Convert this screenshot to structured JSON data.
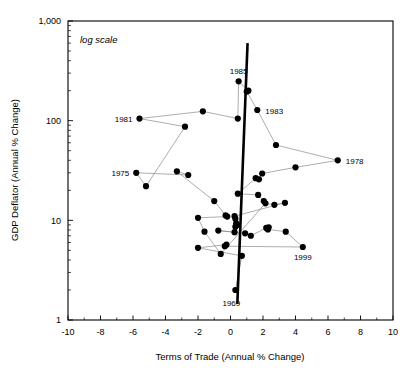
{
  "chart_data": {
    "type": "scatter",
    "title": "",
    "xlabel": "Terms of Trade (Annual % Change)",
    "ylabel": "GDP Deflator (Annual % Change)",
    "annotation": "log scale",
    "yscale": "log",
    "xlim": [
      -10,
      10
    ],
    "ylim": [
      1,
      1000
    ],
    "xticks": [
      -10,
      -8,
      -6,
      -4,
      -2,
      0,
      2,
      4,
      6,
      8,
      10
    ],
    "xtick_labels": [
      "-10",
      "-8",
      "-6",
      "-4",
      "-2",
      "0",
      "2",
      "4",
      "6",
      "8",
      "10"
    ],
    "yticks": [
      1,
      10,
      100,
      1000
    ],
    "ytick_labels": [
      "1",
      "10",
      "100",
      "1,000"
    ],
    "minor_xticks": [
      -9,
      -7,
      -5,
      -3,
      -1,
      1,
      3,
      5,
      7,
      9
    ],
    "grid": false,
    "legend": null,
    "series_connected": true,
    "series_name": "Terms of Trade vs GDP Deflator",
    "point_color": "#000000",
    "connector_color": "#8a8a8a",
    "trendline_color": "#000000",
    "trendline": {
      "x1": 1.05,
      "y1": 600,
      "x2": 0.42,
      "y2": 1.45
    },
    "points": [
      {
        "x": -0.6,
        "y": 4.6
      },
      {
        "x": -1.6,
        "y": 7.7
      },
      {
        "x": -2.0,
        "y": 10.6
      },
      {
        "x": -0.2,
        "y": 10.9
      },
      {
        "x": -0.3,
        "y": 11.2
      },
      {
        "x": -1.0,
        "y": 15.6
      },
      {
        "x": -3.3,
        "y": 31.0
      },
      {
        "x": -2.6,
        "y": 28.5
      },
      {
        "x": -5.8,
        "y": 30.0,
        "label": "1975",
        "label_pos": "left"
      },
      {
        "x": -5.2,
        "y": 22.0
      },
      {
        "x": -2.8,
        "y": 87.0
      },
      {
        "x": -5.6,
        "y": 105.0,
        "label": "1981",
        "label_pos": "left"
      },
      {
        "x": -1.7,
        "y": 124.0
      },
      {
        "x": 0.45,
        "y": 105.0
      },
      {
        "x": 0.5,
        "y": 248.0,
        "label": "1985",
        "label_pos": "above"
      },
      {
        "x": 1.1,
        "y": 200.0
      },
      {
        "x": 1.0,
        "y": 196.0
      },
      {
        "x": 1.65,
        "y": 128.0,
        "label": "1983",
        "label_pos": "right"
      },
      {
        "x": 2.8,
        "y": 57.0
      },
      {
        "x": 6.6,
        "y": 40.0,
        "label": "1978",
        "label_pos": "right"
      },
      {
        "x": 4.0,
        "y": 34.0
      },
      {
        "x": 1.95,
        "y": 29.5
      },
      {
        "x": 1.75,
        "y": 25.8
      },
      {
        "x": 1.55,
        "y": 26.5
      },
      {
        "x": 0.45,
        "y": 18.5
      },
      {
        "x": 1.7,
        "y": 18.0
      },
      {
        "x": 2.05,
        "y": 15.6
      },
      {
        "x": 2.15,
        "y": 14.8
      },
      {
        "x": 2.7,
        "y": 14.3
      },
      {
        "x": 3.35,
        "y": 15.0
      },
      {
        "x": 0.25,
        "y": 11.0
      },
      {
        "x": 0.3,
        "y": 10.4
      },
      {
        "x": 0.35,
        "y": 9.3
      },
      {
        "x": 0.4,
        "y": 9.0
      },
      {
        "x": 0.3,
        "y": 8.6
      },
      {
        "x": 0.25,
        "y": 7.6
      },
      {
        "x": -0.75,
        "y": 7.9
      },
      {
        "x": 0.9,
        "y": 7.4
      },
      {
        "x": 1.25,
        "y": 7.0
      },
      {
        "x": 2.2,
        "y": 8.4
      },
      {
        "x": 2.35,
        "y": 8.5
      },
      {
        "x": 2.3,
        "y": 8.1
      },
      {
        "x": 3.4,
        "y": 7.7
      },
      {
        "x": 4.45,
        "y": 5.4,
        "label": "1999",
        "label_pos": "below"
      },
      {
        "x": -0.35,
        "y": 5.5
      },
      {
        "x": -0.25,
        "y": 5.7
      },
      {
        "x": -2.0,
        "y": 5.3
      },
      {
        "x": 0.7,
        "y": 4.4
      },
      {
        "x": 0.3,
        "y": 2.0,
        "label": "1969",
        "label_pos": "below-left"
      }
    ],
    "path_order": [
      26,
      25,
      24,
      23,
      22,
      21,
      20,
      19,
      18,
      17,
      16,
      15,
      14,
      13,
      12,
      11,
      10,
      9,
      8,
      7,
      6,
      5,
      4,
      3,
      2,
      1,
      0,
      27,
      28,
      29,
      30,
      31,
      32,
      33,
      34,
      35,
      36,
      37,
      38,
      39,
      40,
      41,
      42,
      43,
      44,
      45,
      46,
      47,
      48
    ]
  },
  "labels": {
    "xaxis": "Terms of Trade (Annual % Change)",
    "yaxis": "GDP Deflator (Annual % Change)",
    "note": "log scale"
  }
}
